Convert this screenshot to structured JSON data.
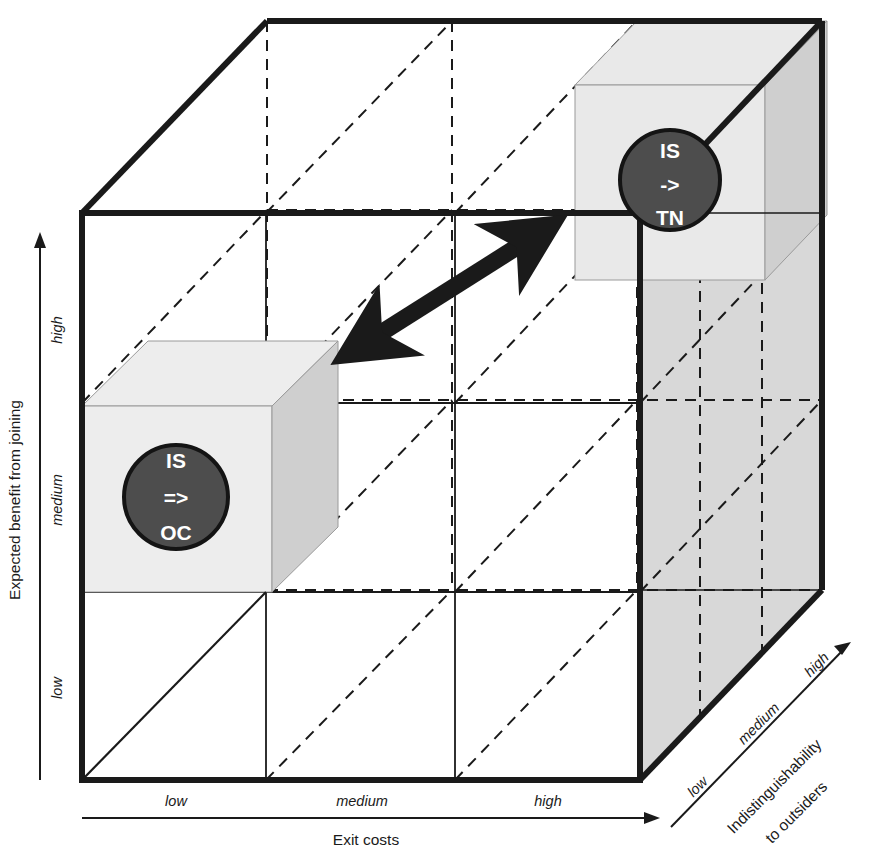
{
  "diagram": {
    "axes": {
      "y": {
        "label": "Expected benefit from joining",
        "ticks": [
          "high",
          "medium",
          "low"
        ]
      },
      "x": {
        "label": "Exit costs",
        "ticks": [
          "low",
          "medium",
          "high"
        ]
      },
      "z": {
        "label_line1": "Indistinguishability",
        "label_line2": "to outsiders",
        "ticks": [
          "low",
          "medium",
          "high"
        ]
      }
    },
    "nodes": [
      {
        "id": "is-oc",
        "line1": "IS",
        "line2": "=>",
        "line3": "OC",
        "fill": "#4d4d4d",
        "stroke": "#111111"
      },
      {
        "id": "is-tn",
        "line1": "IS",
        "line2": "->",
        "line3": "TN",
        "fill": "#4d4d4d",
        "stroke": "#111111"
      }
    ],
    "connector": {
      "name": "bidirectional-arrow",
      "style": "double-headed"
    },
    "colors": {
      "outline": "#1a1a1a",
      "grid_solid": "#1a1a1a",
      "grid_dashed": "#1a1a1a",
      "face_light": "#e8e8e8",
      "face_mid": "#d5d5d5",
      "face_dark": "#c4c4c4",
      "background": "#ffffff",
      "node_fill": "#4d4d4d",
      "node_label": "#ffffff"
    }
  }
}
